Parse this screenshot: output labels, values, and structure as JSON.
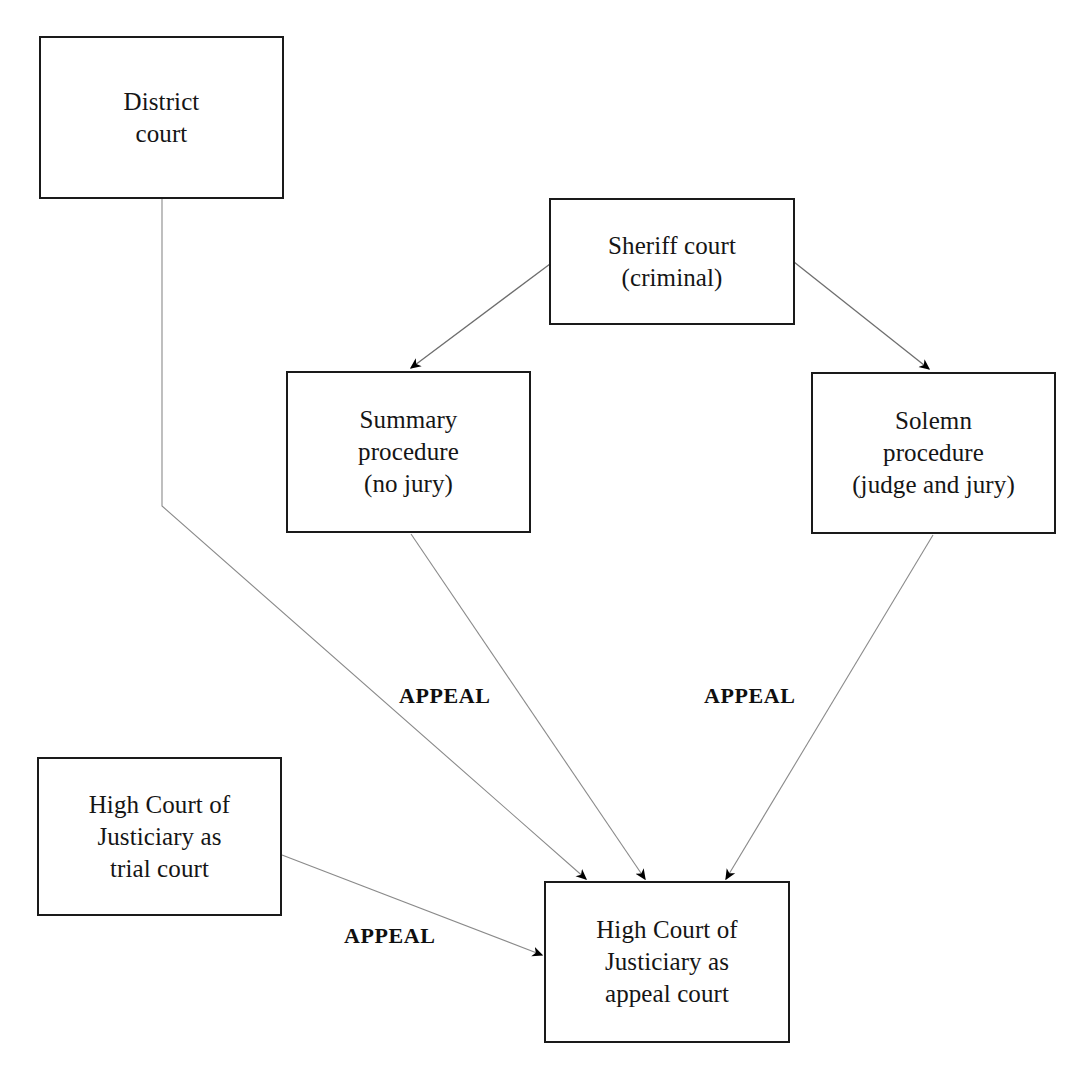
{
  "diagram": {
    "background_color": "#ffffff",
    "node_border_color": "#1a1a1a",
    "edge_color": "#7a7a7a",
    "arrowhead_color": "#000000",
    "nodes": [
      {
        "id": "district-court",
        "label": "District\ncourt"
      },
      {
        "id": "sheriff-court",
        "label": "Sheriff court\n(criminal)"
      },
      {
        "id": "summary-procedure",
        "label": "Summary\nprocedure\n(no jury)"
      },
      {
        "id": "solemn-procedure",
        "label": "Solemn\nprocedure\n(judge and jury)"
      },
      {
        "id": "high-court-trial",
        "label": "High Court of\nJusticiary as\ntrial court"
      },
      {
        "id": "high-court-appeal",
        "label": "High Court of\nJusticiary as\nappeal court"
      }
    ],
    "edges": [
      {
        "id": "sheriff-to-summary",
        "from": "sheriff-court",
        "to": "summary-procedure",
        "label": ""
      },
      {
        "id": "sheriff-to-solemn",
        "from": "sheriff-court",
        "to": "solemn-procedure",
        "label": ""
      },
      {
        "id": "district-to-appeal",
        "from": "district-court",
        "to": "high-court-appeal",
        "label": ""
      },
      {
        "id": "summary-to-appeal",
        "from": "summary-procedure",
        "to": "high-court-appeal",
        "label": "APPEAL"
      },
      {
        "id": "solemn-to-appeal",
        "from": "solemn-procedure",
        "to": "high-court-appeal",
        "label": "APPEAL"
      },
      {
        "id": "trial-to-appeal",
        "from": "high-court-trial",
        "to": "high-court-appeal",
        "label": "APPEAL"
      }
    ],
    "edge_labels": {
      "summary_appeal": "APPEAL",
      "solemn_appeal": "APPEAL",
      "trial_appeal": "APPEAL"
    }
  }
}
